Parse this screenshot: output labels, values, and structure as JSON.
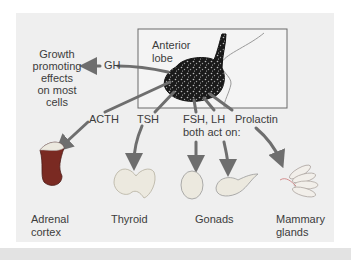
{
  "diagram": {
    "gland_box_label": [
      "Anterior",
      "lobe"
    ],
    "hormones": {
      "gh": "GH",
      "acth": "ACTH",
      "tsh": "TSH",
      "fsh_lh": "FSH, LH",
      "fsh_lh_note": "both act on:",
      "prolactin": "Prolactin"
    },
    "effects": {
      "gh_effect": [
        "Growth",
        "promoting",
        "effects",
        "on most",
        "cells"
      ]
    },
    "targets": {
      "adrenal": [
        "Adrenal",
        "cortex"
      ],
      "thyroid": "Thyroid",
      "gonads": "Gonads",
      "mammary": [
        "Mammary",
        "glands"
      ]
    },
    "colors": {
      "panel": "#efefef",
      "arrow": "#6e6e6e",
      "gland": "#1e1e1e",
      "text": "#3c3c3c",
      "adrenal": "#7a2a22",
      "organ_light": "#ece9df"
    }
  }
}
